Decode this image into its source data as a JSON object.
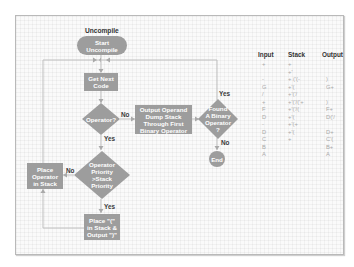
{
  "diagram": {
    "title": "Uncompile",
    "nodes": {
      "start": "Start\nUncompile",
      "get_next_code": "Get Next\nCode",
      "operator_decision": "Operator?",
      "output_operand": "Output Operand\nDump Stack\nThrough First\nBinary Operator",
      "found_binary_decision": "Found\nA Binary\nOperator\n?",
      "end": "End",
      "priority_decision": "Operator\nPriority\n>Stack\nPriority",
      "place_operator": "Place\nOperator\nin Stack",
      "place_paren": "Place \"(\"\nin Stack &\nOutput \")\""
    },
    "edge_labels": {
      "operator_no": "No",
      "operator_yes": "Yes",
      "found_yes": "Yes",
      "found_no": "No",
      "priority_no": "No",
      "priority_yes": "Yes"
    },
    "colors": {
      "node_fill": "#9d9d9d",
      "connector": "#bfbfbf",
      "label_text": "#3a3a3a"
    }
  },
  "trace_table": {
    "headers": [
      "Input",
      "Stack",
      "Output"
    ],
    "rows": [
      [
        "+",
        "+",
        ""
      ],
      [
        "",
        "+'",
        ""
      ],
      [
        "-",
        "+ ('(-",
        ")"
      ],
      [
        "G",
        "+'(",
        "G+"
      ],
      [
        "/",
        "+'('/",
        ""
      ],
      [
        "+",
        "+'('/('+",
        ")"
      ],
      [
        "F",
        "+'('/(",
        "F+"
      ],
      [
        "D",
        "+'(",
        "D('/"
      ],
      [
        "-",
        "+'(+",
        ""
      ],
      [
        "D",
        "+'(",
        "D+"
      ],
      [
        "C",
        "+",
        "C'("
      ],
      [
        "B",
        "",
        "B+"
      ],
      [
        "A",
        "",
        "A"
      ]
    ]
  }
}
